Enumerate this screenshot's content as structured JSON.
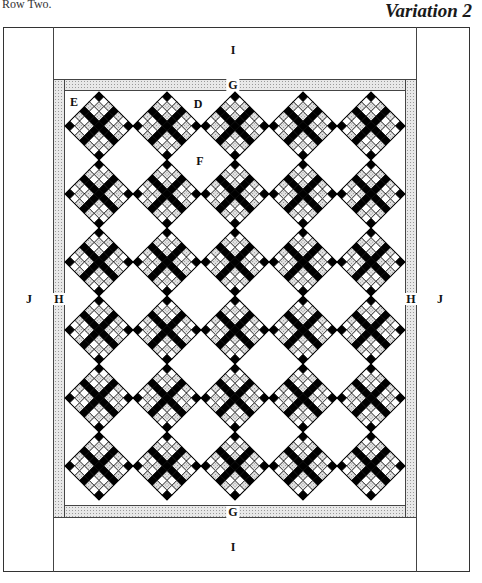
{
  "header": {
    "caption": "Row Two.",
    "title": "Variation 2"
  },
  "quilt": {
    "outer": {
      "left": 3,
      "top": 27,
      "right": 470,
      "bottom": 572
    },
    "border_J": {
      "label": "J",
      "left_inner_x": 53,
      "right_inner_x": 416
    },
    "border_I": {
      "label": "I",
      "top_inner_y": 79,
      "bottom_inner_y": 517
    },
    "border_H": {
      "label": "H",
      "left": [
        53,
        65
      ],
      "right": [
        405,
        416
      ]
    },
    "border_G": {
      "label": "G",
      "top": [
        79,
        91
      ],
      "bottom": [
        505,
        517
      ]
    },
    "field": {
      "left": 65,
      "top": 91,
      "right": 405,
      "bottom": 505
    },
    "blocks": {
      "rows": 6,
      "cols": 5,
      "first_center_x": 99,
      "first_center_y": 126,
      "spacing": 68,
      "half_diagonal": 34,
      "grid_cells": 7,
      "colors": {
        "dark": "#000000",
        "light": "#ffffff",
        "dotted": "#cfcfcf"
      }
    },
    "labels": [
      {
        "id": "label-i-top",
        "text": "I",
        "x": 233,
        "y": 50
      },
      {
        "id": "label-g-top",
        "text": "G",
        "x": 233,
        "y": 85,
        "bg": true
      },
      {
        "id": "label-e",
        "text": "E",
        "x": 74,
        "y": 102
      },
      {
        "id": "label-d",
        "text": "D",
        "x": 198,
        "y": 104
      },
      {
        "id": "label-f",
        "text": "F",
        "x": 200,
        "y": 161
      },
      {
        "id": "label-j-left",
        "text": "J",
        "x": 29,
        "y": 299
      },
      {
        "id": "label-h-left",
        "text": "H",
        "x": 59,
        "y": 299,
        "bg": true
      },
      {
        "id": "label-h-right",
        "text": "H",
        "x": 411,
        "y": 299,
        "bg": true
      },
      {
        "id": "label-j-right",
        "text": "J",
        "x": 440,
        "y": 299
      },
      {
        "id": "label-g-bottom",
        "text": "G",
        "x": 233,
        "y": 512,
        "bg": true
      },
      {
        "id": "label-i-bottom",
        "text": "I",
        "x": 233,
        "y": 547
      }
    ]
  }
}
